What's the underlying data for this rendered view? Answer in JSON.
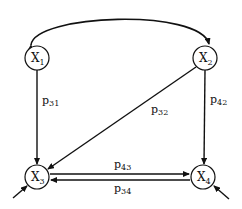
{
  "diagram": {
    "type": "path-diagram",
    "nodes": [
      {
        "id": "X1",
        "base": "X",
        "sub": "1",
        "cx": 37,
        "cy": 58
      },
      {
        "id": "X2",
        "base": "X",
        "sub": "2",
        "cx": 205,
        "cy": 58
      },
      {
        "id": "X3",
        "base": "X",
        "sub": "3",
        "cx": 37,
        "cy": 177
      },
      {
        "id": "X4",
        "base": "X",
        "sub": "4",
        "cx": 203,
        "cy": 177
      }
    ],
    "edges": [
      {
        "from": "X1",
        "to": "X2",
        "kind": "curved-bidirectional-correlation",
        "label": ""
      },
      {
        "from": "X1",
        "to": "X3",
        "label_base": "p",
        "label_sub": "31"
      },
      {
        "from": "X2",
        "to": "X3",
        "label_base": "p",
        "label_sub": "32"
      },
      {
        "from": "X2",
        "to": "X4",
        "label_base": "p",
        "label_sub": "42"
      },
      {
        "from": "X3",
        "to": "X4",
        "label_base": "p",
        "label_sub": "43"
      },
      {
        "from": "X4",
        "to": "X3",
        "label_base": "p",
        "label_sub": "34"
      },
      {
        "from": "error",
        "to": "X3",
        "kind": "disturbance",
        "label": ""
      },
      {
        "from": "error",
        "to": "X4",
        "kind": "disturbance",
        "label": ""
      }
    ],
    "colors": {
      "stroke": "#111111",
      "background": "#ffffff"
    }
  }
}
